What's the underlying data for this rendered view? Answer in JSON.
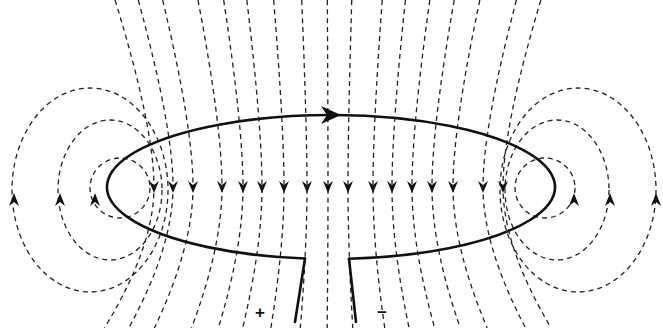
{
  "diagram": {
    "background": "#ffffff",
    "line_color": "#222222",
    "wire_color": "#111111",
    "loop": {
      "shape": "ellipse",
      "cx": 331,
      "cy": 187,
      "rx": 224,
      "ry": 72,
      "current_arrow": {
        "x": 335,
        "y": 117,
        "direction": "right"
      }
    },
    "leads": {
      "left": {
        "from": [
          305,
          274
        ],
        "to": [
          295,
          322
        ]
      },
      "right": {
        "from": [
          349,
          274
        ],
        "to": [
          356,
          322
        ]
      }
    },
    "terminals": [
      {
        "label": "+",
        "x": 262,
        "y": 312
      },
      {
        "label": "−",
        "x": 383,
        "y": 312
      }
    ],
    "inner_field_lines_x": [
      154,
      173,
      193,
      222,
      243,
      262,
      284,
      307,
      328,
      348,
      373,
      392,
      412,
      432,
      453,
      483,
      503
    ],
    "inner_arrow_y": 189,
    "inner_arrow_direction": "down",
    "side_loops": [
      {
        "side": "left",
        "loops": [
          {
            "cx": 120,
            "cy": 188,
            "rx": 30,
            "ry": 30,
            "arrow_x": 95
          },
          {
            "cx": 110,
            "cy": 190,
            "rx": 52,
            "ry": 70,
            "arrow_x": 60
          },
          {
            "cx": 90,
            "cy": 190,
            "rx": 78,
            "ry": 102,
            "arrow_x": 14
          }
        ]
      },
      {
        "side": "right",
        "loops": [
          {
            "cx": 545,
            "cy": 188,
            "rx": 30,
            "ry": 30,
            "arrow_x": 574
          },
          {
            "cx": 557,
            "cy": 190,
            "rx": 52,
            "ry": 70,
            "arrow_x": 610
          },
          {
            "cx": 578,
            "cy": 190,
            "rx": 78,
            "ry": 102,
            "arrow_x": 656
          }
        ]
      }
    ],
    "labels": {
      "plus": "+",
      "minus": "−"
    }
  }
}
